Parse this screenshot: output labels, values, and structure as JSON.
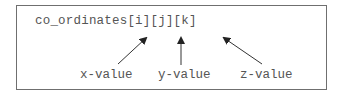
{
  "expression": "co_ordinates[i][j][k]",
  "labels": [
    {
      "text": "x-value",
      "points_to": "i"
    },
    {
      "text": "y-value",
      "points_to": "j"
    },
    {
      "text": "z-value",
      "points_to": "k"
    }
  ],
  "colors": {
    "text": "#555555",
    "border": "#6f6f6f",
    "arrow": "#333333"
  }
}
